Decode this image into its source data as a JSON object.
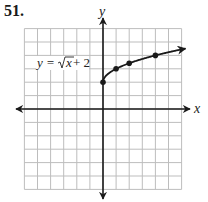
{
  "problem": {
    "number": "51."
  },
  "chart_data": {
    "type": "line",
    "title": "",
    "xlabel": "x",
    "ylabel": "y",
    "equation_label": "y = √x + 2",
    "xlim": [
      -6,
      6
    ],
    "ylim": [
      -6,
      6
    ],
    "grid": true,
    "grid_step": 1,
    "axes_arrows": true,
    "series": [
      {
        "name": "y = √x + 2",
        "x": [
          0,
          1,
          2,
          4
        ],
        "y": [
          2,
          3,
          3.41,
          4
        ],
        "marked_points": [
          [
            0,
            2
          ],
          [
            1,
            3
          ],
          [
            2,
            3.41
          ],
          [
            4,
            4
          ]
        ],
        "arrow_end": true,
        "domain_start": 0
      }
    ]
  },
  "labels": {
    "x_axis": "x",
    "y_axis": "y",
    "equation_prefix": "y = ",
    "equation_radicand": "x",
    "equation_suffix": " + 2"
  }
}
